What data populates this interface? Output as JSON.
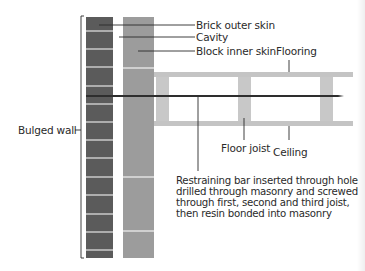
{
  "diagram": {
    "type": "cross-section",
    "labels": {
      "brick_outer_skin": "Brick outer skin",
      "cavity": "Cavity",
      "block_inner_skin": "Block inner skin",
      "flooring": "Flooring",
      "bulged_wall": "Bulged wall",
      "floor_joist": "Floor joist",
      "ceiling": "Ceiling"
    },
    "restraining_bar_note": [
      "Restraining bar inserted through hole",
      "drilled through masonry and screwed",
      "through first, second and third joist,",
      "then resin bonded into masonry"
    ],
    "colors": {
      "brick": "#5b5b5b",
      "block": "#9c9c9c",
      "mortar": "#e6e6e6",
      "floor_slab": "#c4c4c4",
      "joist": "#c8c8c8",
      "bar": "#2e2e2e",
      "leader": "#2a2a2a"
    },
    "joist_count": 3
  }
}
